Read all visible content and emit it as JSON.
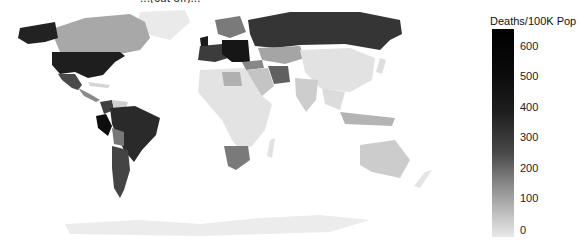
{
  "map": {
    "title_partial": "...(cut off)...",
    "metric": "Deaths/100K Pop",
    "colors": {
      "very_high": "#1a1a1a",
      "high": "#333333",
      "mid_high": "#4d4d4d",
      "mid": "#777777",
      "low_mid": "#a8a8a8",
      "low": "#d0d0d0",
      "very_low": "#e6e6e6",
      "no_data": "#ebebeb"
    },
    "regions": [
      {
        "name": "United States",
        "shade": "very_high"
      },
      {
        "name": "Alaska",
        "shade": "very_high"
      },
      {
        "name": "Canada",
        "shade": "low_mid"
      },
      {
        "name": "Greenland",
        "shade": "no_data"
      },
      {
        "name": "Mexico",
        "shade": "high"
      },
      {
        "name": "Central America",
        "shade": "mid"
      },
      {
        "name": "Peru",
        "shade": "very_high"
      },
      {
        "name": "Brazil",
        "shade": "high"
      },
      {
        "name": "Colombia",
        "shade": "high"
      },
      {
        "name": "Venezuela",
        "shade": "low"
      },
      {
        "name": "Bolivia",
        "shade": "mid"
      },
      {
        "name": "Argentina",
        "shade": "high"
      },
      {
        "name": "Chile",
        "shade": "high"
      },
      {
        "name": "Europe (Central/Eastern)",
        "shade": "very_high"
      },
      {
        "name": "Western Europe",
        "shade": "high"
      },
      {
        "name": "Scandinavia",
        "shade": "mid"
      },
      {
        "name": "Russia",
        "shade": "high"
      },
      {
        "name": "Kazakhstan",
        "shade": "low_mid"
      },
      {
        "name": "Iran",
        "shade": "mid"
      },
      {
        "name": "Turkey",
        "shade": "mid"
      },
      {
        "name": "China",
        "shade": "very_low"
      },
      {
        "name": "India",
        "shade": "low"
      },
      {
        "name": "Africa",
        "shade": "very_low"
      },
      {
        "name": "South Africa",
        "shade": "mid"
      },
      {
        "name": "Libya",
        "shade": "low_mid"
      },
      {
        "name": "Indonesia",
        "shade": "low_mid"
      },
      {
        "name": "Australia",
        "shade": "low"
      },
      {
        "name": "New Zealand",
        "shade": "very_low"
      },
      {
        "name": "Antarctica",
        "shade": "no_data"
      }
    ]
  },
  "legend": {
    "title": "Deaths/100K Pop",
    "ticks": [
      "600",
      "500",
      "400",
      "300",
      "200",
      "100",
      "0"
    ],
    "min": 0,
    "max": 660
  }
}
